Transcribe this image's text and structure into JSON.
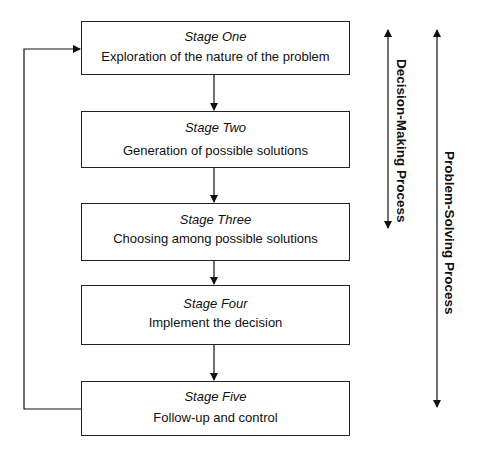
{
  "diagram": {
    "stages": [
      {
        "label": "Stage One",
        "description": "Exploration of the nature of the problem"
      },
      {
        "label": "Stage Two",
        "description": "Generation of possible solutions"
      },
      {
        "label": "Stage Three",
        "description": "Choosing among possible solutions"
      },
      {
        "label": "Stage Four",
        "description": "Implement the decision"
      },
      {
        "label": "Stage Five",
        "description": "Follow-up and control"
      }
    ],
    "side_labels": {
      "decision_making": "Decision-Making Process",
      "problem_solving": "Problem-Solving Process"
    },
    "feedback_loop": "Stage Five returns to Stage One"
  }
}
